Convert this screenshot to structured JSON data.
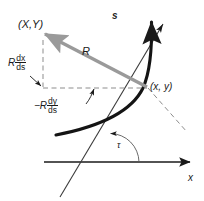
{
  "figure": {
    "background": "#ffffff",
    "ink": "#1a1a1a",
    "accent_gray": "#999999",
    "width": 204,
    "height": 201
  },
  "labels": {
    "point_XY": "(X,Y)",
    "point_xy": "(x, y)",
    "vector_R": "R",
    "arc_length_s": "s",
    "axis_x": "x",
    "angle_tau": "τ",
    "component_vertical": {
      "coefficient": "R",
      "numerator": "dx",
      "denominator": "ds"
    },
    "component_horizontal": {
      "coefficient": "−R",
      "numerator": "dy",
      "denominator": "ds"
    }
  },
  "geometry": {
    "point_xy": {
      "x": 148,
      "y": 88
    },
    "point_XY": {
      "x": 44,
      "y": 38
    },
    "x_axis": {
      "x1": 44,
      "y1": 162,
      "x2": 192,
      "y2": 162
    },
    "tangent_line": {
      "x1": 60,
      "y1": 196,
      "x2": 164,
      "y2": 22
    },
    "normal_dashed": {
      "x1": 148,
      "y1": 88,
      "x2": 186,
      "y2": 131
    },
    "tau_arc_radius": 34
  },
  "elements": {
    "curve_name": "arc-length-curve",
    "vector_name": "radius-vector",
    "dashed_name": "component-dashed-triangle"
  }
}
